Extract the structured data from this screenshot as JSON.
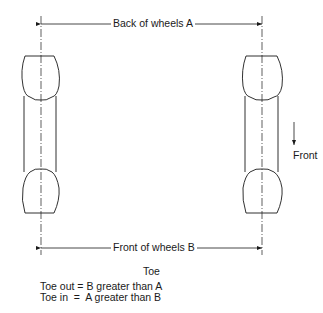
{
  "diagram": {
    "dimension_top": {
      "label": "Back of wheels A"
    },
    "dimension_bottom": {
      "label": "Front of wheels B"
    },
    "direction": {
      "label": "Front"
    },
    "caption": {
      "title": "Toe",
      "lines": [
        "Toe out = B greater than A",
        "Toe in  =  A greater than B"
      ]
    },
    "colors": {
      "line": "#1a1a1a",
      "background": "#ffffff"
    }
  }
}
